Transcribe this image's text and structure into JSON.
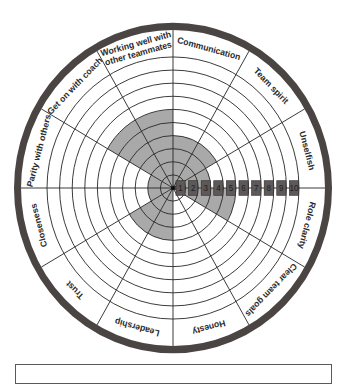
{
  "diagram": {
    "center": {
      "x": 173,
      "y": 188
    },
    "scale_x": 1.0,
    "scale_y": 1.04,
    "ring_count": 10,
    "ring_spacing": 12.6,
    "label_band_outer_radius": 152,
    "outer_ring_width": 7,
    "colors": {
      "outer_ring": "#4a4443",
      "shade": "#a9a9a9",
      "lines": "#2b2b2b",
      "scale_box": "#5e5859",
      "background": "#ffffff"
    },
    "scale_labels": [
      "1",
      "2",
      "3",
      "4",
      "5",
      "6",
      "7",
      "8",
      "9",
      "10"
    ],
    "segments": [
      {
        "label": [
          "Communication"
        ],
        "value": 4
      },
      {
        "label": [
          "Team spirit"
        ],
        "value": 4
      },
      {
        "label": [
          "Unselfish"
        ],
        "value": 3
      },
      {
        "label": [
          "Role clarity"
        ],
        "value": 5
      },
      {
        "label": [
          "Clear team goals"
        ],
        "value": 0
      },
      {
        "label": [
          "Honesty"
        ],
        "value": 0
      },
      {
        "label": [
          "Leadership"
        ],
        "value": 4
      },
      {
        "label": [
          "Trust"
        ],
        "value": 4
      },
      {
        "label": [
          "Closeness"
        ],
        "value": 2
      },
      {
        "label": [
          "Parity with others"
        ],
        "value": 2
      },
      {
        "label": [
          "Get on with coach"
        ],
        "value": 6
      },
      {
        "label": [
          "Working well with",
          "other teammates"
        ],
        "value": 6
      }
    ]
  },
  "chart_data": {
    "type": "radial-wheel",
    "title": "",
    "scale": {
      "min": 1,
      "max": 10
    },
    "categories": [
      "Communication",
      "Team spirit",
      "Unselfish",
      "Role clarity",
      "Clear team goals",
      "Honesty",
      "Leadership",
      "Trust",
      "Closeness",
      "Parity with others",
      "Get on with coach",
      "Working well with other teammates"
    ],
    "values": [
      4,
      4,
      3,
      5,
      0,
      0,
      4,
      4,
      2,
      2,
      6,
      6
    ]
  },
  "caption_box": {
    "text": ""
  }
}
